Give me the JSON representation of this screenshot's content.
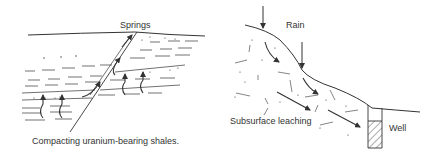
{
  "figure": {
    "left_panel": {
      "label_springs": "Springs",
      "caption": "Compacting uranium-bearing shales."
    },
    "right_panel": {
      "label_rain": "Rain",
      "label_leaching": "Subsurface leaching",
      "label_well": "Well"
    },
    "colors": {
      "ink": "#333333",
      "background": "#ffffff"
    }
  }
}
